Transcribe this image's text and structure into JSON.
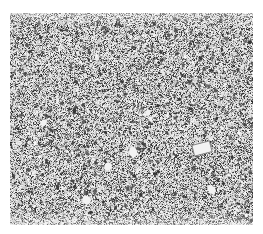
{
  "image": {
    "description": "Grayscale granular speckle texture (micrograph-like) on white background",
    "alt": "Grayscale granular speckle texture",
    "width": 263,
    "height": 234,
    "texture_region": {
      "x": 10,
      "y": 13,
      "width": 243,
      "height": 212
    },
    "colors": {
      "background": "#ffffff",
      "base": "#d8d8d8",
      "dark": "#3a3a3a",
      "mid": "#8a8a8a",
      "light": "#f2f2f2"
    },
    "light_features": [
      {
        "x": 193,
        "y": 143,
        "w": 18,
        "h": 11,
        "kind": "rect-outline"
      },
      {
        "x": 128,
        "y": 148,
        "w": 10,
        "h": 8,
        "kind": "blob"
      },
      {
        "x": 104,
        "y": 163,
        "w": 8,
        "h": 7,
        "kind": "blob"
      },
      {
        "x": 207,
        "y": 186,
        "w": 9,
        "h": 7,
        "kind": "blob"
      },
      {
        "x": 82,
        "y": 196,
        "w": 9,
        "h": 8,
        "kind": "blob"
      },
      {
        "x": 40,
        "y": 120,
        "w": 7,
        "h": 6,
        "kind": "blob"
      },
      {
        "x": 145,
        "y": 110,
        "w": 6,
        "h": 5,
        "kind": "blob"
      }
    ],
    "seed": 1337
  }
}
